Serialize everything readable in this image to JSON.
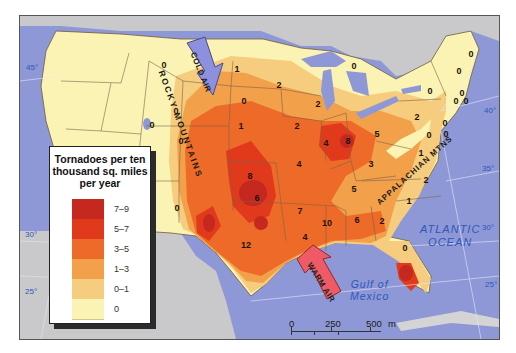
{
  "map": {
    "subject": "Tornado frequency across the contiguous United States",
    "colors": {
      "water": "#8f98d6",
      "land_outside": "#c9c9cc",
      "class_0": "#fbf3b4",
      "class_0_1": "#f6cc7e",
      "class_1_3": "#f3a04a",
      "class_3_5": "#ee6a28",
      "class_5_7": "#e0391c",
      "class_7_9": "#c4281e",
      "cold_air_arrow": "#8d8fdf",
      "warm_air_arrow": "#ee5a66"
    }
  },
  "legend": {
    "title": "Tornadoes per ten thousand sq. miles per year",
    "title_lines": [
      "Tornadoes per ten",
      "thousand sq. miles",
      "per year"
    ],
    "items": [
      {
        "label": "7–9",
        "color": "#c4281e"
      },
      {
        "label": "5–7",
        "color": "#e0391c"
      },
      {
        "label": "3–5",
        "color": "#ee6a28"
      },
      {
        "label": "1–3",
        "color": "#f3a04a"
      },
      {
        "label": "0–1",
        "color": "#f6cc7e"
      },
      {
        "label": "0",
        "color": "#fbf3b4"
      }
    ]
  },
  "labels": {
    "rocky_mountains": "ROCKY MOUNTAINS",
    "appalachian_mtns": "APPALACHIAN MTNS",
    "cold_air": "COLD AIR",
    "warm_air": "WARM AIR",
    "atlantic_line1": "ATLANTIC",
    "atlantic_line2": "OCEAN",
    "gulf_line1": "Gulf of",
    "gulf_line2": "Mexico"
  },
  "latitudes": {
    "west": [
      "45°",
      "30°",
      "25°"
    ],
    "east": [
      "40°",
      "35°",
      "30°",
      "25°"
    ]
  },
  "scale_bar": {
    "miles_ticks": [
      "0",
      "250",
      "500"
    ],
    "miles_unit": "m",
    "km_ticks": [
      "0",
      "250",
      "500"
    ],
    "km_unit": "km"
  },
  "values": [
    {
      "v": "0",
      "x": 163,
      "y": 64
    },
    {
      "v": "0",
      "x": 175,
      "y": 110
    },
    {
      "v": "0",
      "x": 180,
      "y": 140
    },
    {
      "v": "0",
      "x": 176,
      "y": 207
    },
    {
      "v": "0",
      "x": 151,
      "y": 124
    },
    {
      "v": "1",
      "x": 236,
      "y": 68
    },
    {
      "v": "0",
      "x": 243,
      "y": 100
    },
    {
      "v": "2",
      "x": 278,
      "y": 84
    },
    {
      "v": "2",
      "x": 317,
      "y": 103
    },
    {
      "v": "2",
      "x": 296,
      "y": 125
    },
    {
      "v": "1",
      "x": 240,
      "y": 125
    },
    {
      "v": "0",
      "x": 353,
      "y": 65
    },
    {
      "v": "0",
      "x": 470,
      "y": 53
    },
    {
      "v": "0",
      "x": 458,
      "y": 70
    },
    {
      "v": "0",
      "x": 429,
      "y": 90
    },
    {
      "v": "0",
      "x": 461,
      "y": 92
    },
    {
      "v": "0",
      "x": 455,
      "y": 100
    },
    {
      "v": "0",
      "x": 465,
      "y": 100
    },
    {
      "v": "0",
      "x": 445,
      "y": 133
    },
    {
      "v": "0",
      "x": 428,
      "y": 134
    },
    {
      "v": "0",
      "x": 444,
      "y": 122
    },
    {
      "v": "2",
      "x": 416,
      "y": 116
    },
    {
      "v": "4",
      "x": 325,
      "y": 142
    },
    {
      "v": "8",
      "x": 347,
      "y": 140
    },
    {
      "v": "5",
      "x": 376,
      "y": 133
    },
    {
      "v": "4",
      "x": 298,
      "y": 163
    },
    {
      "v": "8",
      "x": 249,
      "y": 175
    },
    {
      "v": "6",
      "x": 256,
      "y": 197
    },
    {
      "v": "7",
      "x": 299,
      "y": 210
    },
    {
      "v": "12",
      "x": 245,
      "y": 244
    },
    {
      "v": "3",
      "x": 370,
      "y": 163
    },
    {
      "v": "1",
      "x": 420,
      "y": 152
    },
    {
      "v": "5",
      "x": 353,
      "y": 188
    },
    {
      "v": "2",
      "x": 425,
      "y": 179
    },
    {
      "v": "1",
      "x": 408,
      "y": 200
    },
    {
      "v": "10",
      "x": 326,
      "y": 222
    },
    {
      "v": "6",
      "x": 356,
      "y": 219
    },
    {
      "v": "2",
      "x": 381,
      "y": 220
    },
    {
      "v": "4",
      "x": 304,
      "y": 236
    },
    {
      "v": "0",
      "x": 404,
      "y": 247
    }
  ]
}
